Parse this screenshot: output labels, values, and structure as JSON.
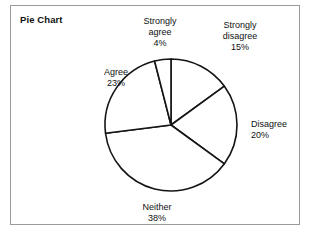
{
  "chart": {
    "title": "Pie Chart"
  },
  "chart_data": {
    "type": "pie",
    "title": "Pie Chart",
    "xlabel": "",
    "ylabel": "",
    "legend": "none",
    "grid": false,
    "start_angle_deg": 0,
    "direction": "clockwise",
    "unit": "%",
    "categories": [
      "Strongly disagree",
      "Disagree",
      "Neither",
      "Agree",
      "Strongly agree"
    ],
    "values": [
      15,
      20,
      38,
      23,
      4
    ],
    "slices": [
      {
        "label": "Strongly disagree",
        "value": 15,
        "value_text": "15%",
        "label_line1": "Strongly",
        "label_line2": "disagree",
        "color": "#ffffff",
        "stroke": "#141414"
      },
      {
        "label": "Disagree",
        "value": 20,
        "value_text": "20%",
        "label_line1": "Disagree",
        "label_line2": "",
        "color": "#ffffff",
        "stroke": "#141414"
      },
      {
        "label": "Neither",
        "value": 38,
        "value_text": "38%",
        "label_line1": "Neither",
        "label_line2": "",
        "color": "#ffffff",
        "stroke": "#141414"
      },
      {
        "label": "Agree",
        "value": 23,
        "value_text": "23%",
        "label_line1": "Agree",
        "label_line2": "",
        "color": "#ffffff",
        "stroke": "#141414"
      },
      {
        "label": "Strongly agree",
        "value": 4,
        "value_text": "4%",
        "label_line1": "Strongly",
        "label_line2": "agree",
        "color": "#ffffff",
        "stroke": "#141414"
      }
    ]
  },
  "geometry": {
    "center_x": 170,
    "center_y": 124,
    "radius": 66
  },
  "colors": {
    "frame": "#9a9a9a",
    "outline": "#141414",
    "fill": "#ffffff",
    "text": "#111111"
  }
}
